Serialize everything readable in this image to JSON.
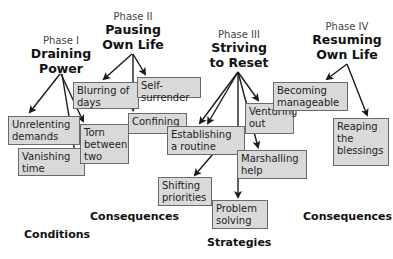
{
  "phases": [
    {
      "num": "Phase I",
      "name_line1": "Draining",
      "name_line2": "Power"
    },
    {
      "num": "Phase II",
      "name_line1": "Pausing",
      "name_line2": "Own Life"
    },
    {
      "num": "Phase III",
      "name_line1": "Striving",
      "name_line2": "to Reset"
    },
    {
      "num": "Phase IV",
      "name_line1": "Resuming",
      "name_line2": "Own Life"
    }
  ],
  "boxes": {
    "unrelenting_demands": "Unrelenting\ndemands",
    "torn_between_two": "Torn\nbetween\ntwo",
    "vanishing_time": "Vanishing\ntime",
    "blurring_of_days": "Blurring of\ndays",
    "self_surrender": "Self-surrender",
    "confining": "Confining",
    "establishing_routine": "Establishing\na routine",
    "shifting_priorities": "Shifting\npriorities",
    "venturing_out": "Venturing\nout",
    "marshalling_help": "Marshalling\nhelp",
    "problem_solving": "Problem\nsolving",
    "becoming_manageable": "Becoming\nmanageable",
    "reaping_blessings": "Reaping\nthe\nblessings"
  },
  "sections": {
    "conditions": "Conditions",
    "consequences_left": "Consequences",
    "strategies": "Strategies",
    "consequences_right": "Consequences"
  },
  "colors": {
    "box_fill": "#d9d9d9",
    "box_border": "#6a6a6a",
    "arrow": "#1a1a1a"
  }
}
